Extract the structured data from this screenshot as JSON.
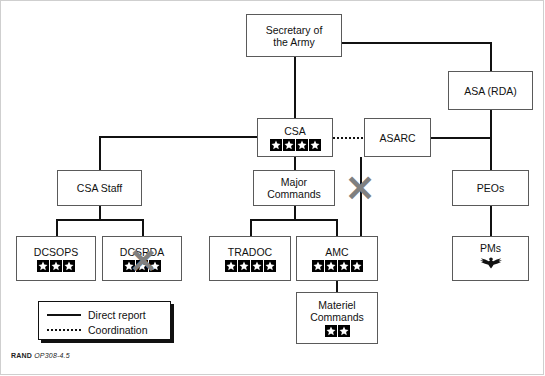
{
  "diagram": {
    "credit_bold": "RAND",
    "credit_italic": "OP308-4.5",
    "colors": {
      "line": "#111111",
      "box_border": "#5a5a5a",
      "x_overlay": "#808080",
      "background": "#ffffff"
    },
    "nodes": [
      {
        "id": "sec-army",
        "label": "Secretary of\nthe Army",
        "stars": 0
      },
      {
        "id": "asa-rda",
        "label": "ASA (RDA)",
        "stars": 0
      },
      {
        "id": "csa",
        "label": "CSA",
        "stars": 4
      },
      {
        "id": "asarc",
        "label": "ASARC",
        "stars": 0
      },
      {
        "id": "csa-staff",
        "label": "CSA Staff",
        "stars": 0
      },
      {
        "id": "major-cmds",
        "label": "Major\nCommands",
        "stars": 0
      },
      {
        "id": "peos",
        "label": "PEOs",
        "stars": 0
      },
      {
        "id": "dcsops",
        "label": "DCSOPS",
        "stars": 3
      },
      {
        "id": "dcsrda",
        "label": "DCSRDA",
        "stars": 3,
        "crossed_out": true
      },
      {
        "id": "tradoc",
        "label": "TRADOC",
        "stars": 4
      },
      {
        "id": "amc",
        "label": "AMC",
        "stars": 4
      },
      {
        "id": "pms",
        "label": "PMs",
        "stars": 0,
        "insignia": "eagle-insignia"
      },
      {
        "id": "materiel",
        "label": "Materiel\nCommands",
        "stars": 2
      }
    ],
    "legend": {
      "items": [
        {
          "key": "solid",
          "label": "Direct report"
        },
        {
          "key": "dotted",
          "label": "Coordination"
        }
      ]
    }
  }
}
